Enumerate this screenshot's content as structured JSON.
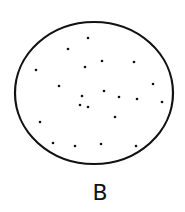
{
  "diagram": {
    "label": "B",
    "colors": {
      "ink": "#111111",
      "background": "#ffffff"
    },
    "dot_count": 21
  }
}
